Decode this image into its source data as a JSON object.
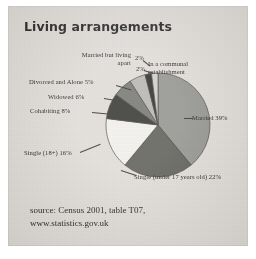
{
  "figure": {
    "title": "Living arrangements",
    "source_lines": [
      "source: Census 2001, table T07,",
      "www.statistics.gov.uk"
    ]
  },
  "labels": {
    "married_but_living_apart": "Married but\nliving apart",
    "married_but_living_apart_pct": "2%",
    "in_a_communal_establishment": "In a communal establishment",
    "in_a_communal_establishment_pct": "2%",
    "divorced_and_alone": "Divorced and Alone 5%",
    "widowed": "Widowed 6%",
    "cohabiting": "Cohabiting 8%",
    "single_18_plus": "Single (18+) 16%",
    "married": "Married 39%",
    "single_under_17": "Single (under 17 years old) 22%"
  },
  "colors": {
    "card_background": "#dfdbd7",
    "page_background": "#ffffff",
    "text": "#16110e",
    "married": "#8d8d8a",
    "single_under_17": "#55554f",
    "single_18_plus": "#f2f0ec",
    "cohabiting": "#2a2a26",
    "widowed": "#6f6f6a",
    "divorced_and_alone": "#b4b2ad",
    "married_but_living_apart": "#1f1f1c",
    "in_a_communal_establishment": "#cfcdc8",
    "slice_outline": "#3a3632"
  },
  "chart_data": {
    "type": "pie",
    "title": "Living arrangements",
    "xlabel": "",
    "ylabel": "",
    "legend_position": "none",
    "units": "percent",
    "start_angle_deg": 0,
    "direction": "clockwise",
    "categories": [
      "Married",
      "Single (under 17 years old)",
      "Single (18+)",
      "Cohabiting",
      "Widowed",
      "Divorced and Alone",
      "Married but living apart",
      "In a communal establishment"
    ],
    "values": [
      39,
      22,
      16,
      8,
      6,
      5,
      2,
      2
    ],
    "slices": [
      {
        "label": "Married",
        "value": 39,
        "display": "Married 39%",
        "color": "#8d8d8a"
      },
      {
        "label": "Single (under 17 years old)",
        "value": 22,
        "display": "Single (under 17 years old) 22%",
        "color": "#55554f"
      },
      {
        "label": "Single (18+)",
        "value": 16,
        "display": "Single (18+) 16%",
        "color": "#f2f0ec"
      },
      {
        "label": "Cohabiting",
        "value": 8,
        "display": "Cohabiting 8%",
        "color": "#2a2a26"
      },
      {
        "label": "Widowed",
        "value": 6,
        "display": "Widowed 6%",
        "color": "#6f6f6a"
      },
      {
        "label": "Divorced and Alone",
        "value": 5,
        "display": "Divorced and Alone 5%",
        "color": "#b4b2ad"
      },
      {
        "label": "Married but living apart",
        "value": 2,
        "display": "2%",
        "color": "#1f1f1c"
      },
      {
        "label": "In a communal establishment",
        "value": 2,
        "display": "2%",
        "color": "#cfcdc8"
      }
    ],
    "total": 100,
    "annotations": [
      "source: Census 2001, table T07,",
      "www.statistics.gov.uk"
    ]
  }
}
